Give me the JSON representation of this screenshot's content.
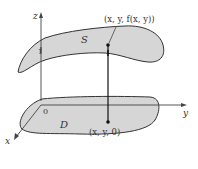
{
  "diagram": {
    "axes": {
      "z_label": "z",
      "y_label": "y",
      "x_label": "x",
      "origin_label": "0",
      "unit_tick_label": "1"
    },
    "surface": {
      "label": "S",
      "point_label": "(x, y, f(x, y))"
    },
    "region": {
      "label": "D",
      "point_label": "(x, y, 0)"
    },
    "colors": {
      "fill": "#d6d6d6",
      "stroke": "#333333",
      "axis": "#444444",
      "background": "#ffffff"
    }
  }
}
